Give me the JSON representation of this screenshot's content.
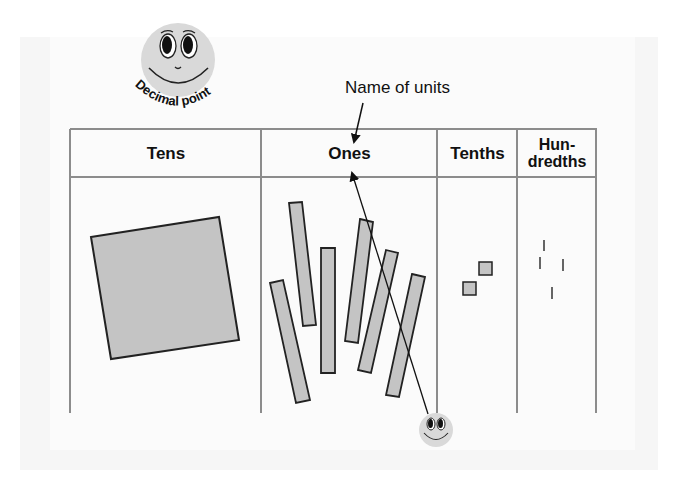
{
  "diagram": {
    "annotation": "Name of units",
    "decimal_point_label": "Decimal point",
    "columns": [
      {
        "key": "tens",
        "label": "Tens",
        "items": {
          "kind": "flat square",
          "count": 1
        }
      },
      {
        "key": "ones",
        "label": "Ones",
        "items": {
          "kind": "rod",
          "count": 6
        }
      },
      {
        "key": "tenths",
        "label": "Tenths",
        "items": {
          "kind": "small square",
          "count": 2
        }
      },
      {
        "key": "hundredths",
        "label_line1": "Hun-",
        "label_line2": "dredths",
        "items": {
          "kind": "tick",
          "count": 4
        }
      }
    ],
    "colors": {
      "grid_line": "#8c8c8c",
      "block_fill": "#c4c4c4",
      "block_stroke": "#222222",
      "face_fill": "#d9d9d9",
      "panel_bg": "#f6f6f6"
    }
  }
}
